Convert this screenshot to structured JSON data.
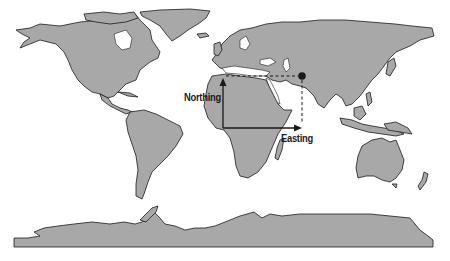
{
  "map": {
    "projection": "world-equirectangular",
    "colors": {
      "land": "#a8a8a8",
      "coast": "#1a1a1a",
      "water": "#ffffff",
      "annotation": "#1a1a1a"
    },
    "labels": {
      "northing": "Northing",
      "easting": "Easting"
    },
    "annotation": {
      "origin": {
        "x": 223,
        "y": 128
      },
      "point": {
        "x": 302,
        "y": 76
      },
      "marker": "filled-circle"
    }
  }
}
